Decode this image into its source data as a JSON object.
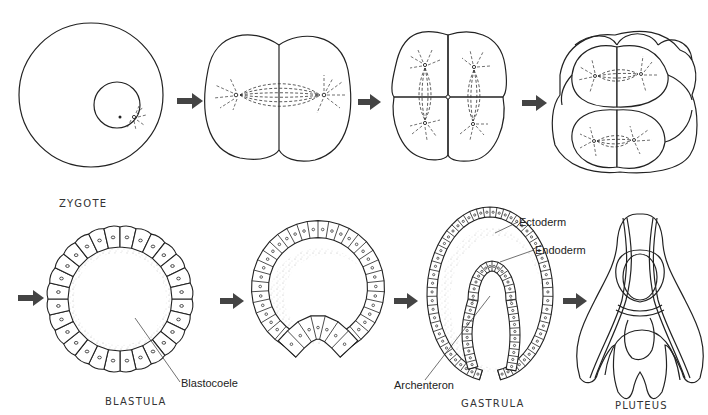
{
  "stages": [
    {
      "id": "zygote",
      "label": "ZYGOTE"
    },
    {
      "id": "two-cell",
      "label": ""
    },
    {
      "id": "four-cell",
      "label": ""
    },
    {
      "id": "eight-cell",
      "label": ""
    },
    {
      "id": "blastula",
      "label": "BLASTULA"
    },
    {
      "id": "early-gastrula",
      "label": ""
    },
    {
      "id": "gastrula",
      "label": "GASTRULA"
    },
    {
      "id": "pluteus",
      "label": "PLUTEUS"
    }
  ],
  "annotations": {
    "blastocoele": "Blastocoele",
    "ectoderm": "Ectoderm",
    "endoderm": "Endoderm",
    "archenteron": "Archenteron"
  },
  "colors": {
    "line": "#222222",
    "arrow": "#444444",
    "background": "#ffffff"
  }
}
